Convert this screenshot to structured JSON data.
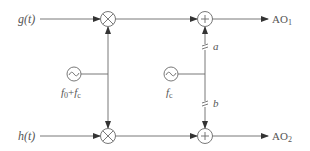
{
  "diagram": {
    "inputs": [
      {
        "id": "g",
        "label": "g(t)"
      },
      {
        "id": "h",
        "label": "h(t)"
      }
    ],
    "outputs": [
      {
        "id": "ao1",
        "label": "AO",
        "sub": "1"
      },
      {
        "id": "ao2",
        "label": "AO",
        "sub": "2"
      }
    ],
    "oscillators": [
      {
        "id": "osc1",
        "symbol": "~",
        "label_main": "f",
        "label_sub0": "0",
        "label_plus": "+",
        "label_f2": "f",
        "label_sub2": "c"
      },
      {
        "id": "osc2",
        "symbol": "~",
        "label_main": "f",
        "label_sub": "c"
      }
    ],
    "multipliers": [
      {
        "id": "mix-top",
        "symbol": "⊗"
      },
      {
        "id": "mix-bottom",
        "symbol": "⊗"
      }
    ],
    "adders": [
      {
        "id": "add-top",
        "symbol": "+"
      },
      {
        "id": "add-bottom",
        "symbol": "+"
      }
    ],
    "switches": [
      {
        "id": "switch-a",
        "label": "a"
      },
      {
        "id": "switch-b",
        "label": "b"
      }
    ],
    "colors": {
      "line": "#6a6a6a",
      "text": "#555555",
      "arrow": "#333333"
    }
  }
}
